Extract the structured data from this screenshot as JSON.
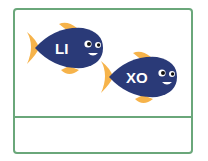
{
  "fish": [
    {
      "name": "LI",
      "label": "LI"
    },
    {
      "name": "XO",
      "label": "XO"
    }
  ],
  "answer_box": {
    "value": ""
  },
  "colors": {
    "border": "#6aa77a",
    "fish_body": "#2a3a78",
    "fin": "#f6b34a",
    "label": "#ffffff"
  }
}
